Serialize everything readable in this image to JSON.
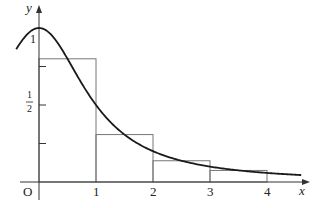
{
  "chart_data": {
    "type": "line",
    "title": "",
    "xlabel": "x",
    "ylabel": "y",
    "origin_label": "O",
    "x_ticks": [
      {
        "value": 1,
        "label": "1"
      },
      {
        "value": 2,
        "label": "2"
      },
      {
        "value": 3,
        "label": "3"
      },
      {
        "value": 4,
        "label": "4"
      }
    ],
    "y_ticks": [
      {
        "value": 0.25,
        "label": ""
      },
      {
        "value": 0.5,
        "label": "1/2"
      },
      {
        "value": 0.75,
        "label": ""
      },
      {
        "value": 1,
        "label": "1"
      }
    ],
    "xlim": [
      -0.4,
      4.7
    ],
    "ylim": [
      0,
      1.1
    ],
    "grid": false,
    "curve": {
      "x": [
        -0.4,
        -0.2,
        0,
        0.25,
        0.5,
        0.75,
        1,
        1.25,
        1.5,
        1.75,
        2,
        2.5,
        3,
        3.5,
        4,
        4.6
      ],
      "y": [
        0.862,
        0.962,
        1.0,
        0.941,
        0.8,
        0.64,
        0.5,
        0.39,
        0.308,
        0.246,
        0.2,
        0.138,
        0.1,
        0.075,
        0.059,
        0.045
      ]
    },
    "rectangles": [
      {
        "x0": 0,
        "x1": 1,
        "height": 0.8
      },
      {
        "x0": 1,
        "x1": 2,
        "height": 0.308
      },
      {
        "x0": 2,
        "x1": 3,
        "height": 0.138
      },
      {
        "x0": 3,
        "x1": 4,
        "height": 0.075
      }
    ],
    "colors": {
      "curve": "#1a1a1a",
      "rect": "#777777",
      "axis": "#333333"
    }
  }
}
